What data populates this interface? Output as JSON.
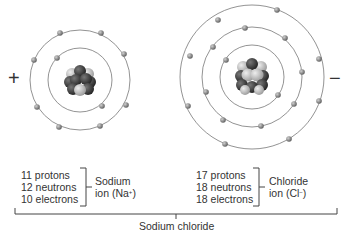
{
  "diagram": {
    "title": "Sodium chloride",
    "sodium": {
      "charge_sign": "+",
      "lines": [
        "11 protons",
        "12 neutrons",
        "10 electrons"
      ],
      "label_line1": "Sodium",
      "label_line2_prefix": "ion (Na",
      "label_line2_sup": "+",
      "label_line2_suffix": ")",
      "shells": [
        {
          "radius": 32,
          "electrons": 2
        },
        {
          "radius": 50,
          "electrons": 8
        }
      ]
    },
    "chloride": {
      "charge_sign": "−",
      "lines": [
        "17 protons",
        "18 neutrons",
        "18 electrons"
      ],
      "label_line1": "Chloride",
      "label_line2_prefix": "ion (Cl",
      "label_line2_sup": "−",
      "label_line2_suffix": ")",
      "shells": [
        {
          "radius": 32,
          "electrons": 2
        },
        {
          "radius": 50,
          "electrons": 8
        },
        {
          "radius": 72,
          "electrons": 8
        }
      ]
    },
    "colors": {
      "orbit": "#777777",
      "electron": "#8a8a8a",
      "nucleus_dark": "#3a3a3a",
      "nucleus_mid": "#7a7a7a",
      "nucleus_light": "#c8c8c8",
      "text": "#333333"
    }
  }
}
